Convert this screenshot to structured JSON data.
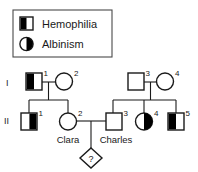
{
  "diagram": {
    "type": "pedigree-chart",
    "colors": {
      "fill": "#000000",
      "empty": "#ffffff",
      "stroke": "#1a1a1a",
      "legend_border": "#4a4a4a",
      "background": "#ffffff"
    },
    "legend": {
      "items": [
        {
          "key": "hemophilia",
          "label": "Hemophilia",
          "shape": "square",
          "fill_half": "left",
          "icon": "half-filled-square-icon"
        },
        {
          "key": "albinism",
          "label": "Albinism",
          "shape": "circle",
          "fill_half": "right",
          "icon": "half-filled-circle-icon"
        }
      ]
    },
    "generations": [
      {
        "key": "I",
        "label": "I"
      },
      {
        "key": "II",
        "label": "II"
      }
    ],
    "individuals": [
      {
        "id": "I-1",
        "generation": "I",
        "number": "1",
        "shape": "square",
        "sex": "male",
        "fill_half": "left",
        "affected": "hemophilia",
        "name": ""
      },
      {
        "id": "I-2",
        "generation": "I",
        "number": "2",
        "shape": "circle",
        "sex": "female",
        "fill_half": "none",
        "affected": "",
        "name": ""
      },
      {
        "id": "I-3",
        "generation": "I",
        "number": "3",
        "shape": "square",
        "sex": "male",
        "fill_half": "none",
        "affected": "",
        "name": ""
      },
      {
        "id": "I-4",
        "generation": "I",
        "number": "4",
        "shape": "circle",
        "sex": "female",
        "fill_half": "none",
        "affected": "",
        "name": ""
      },
      {
        "id": "II-1",
        "generation": "II",
        "number": "1",
        "shape": "square",
        "sex": "male",
        "fill_half": "right",
        "affected": "hemophilia",
        "name": ""
      },
      {
        "id": "II-2",
        "generation": "II",
        "number": "2",
        "shape": "circle",
        "sex": "female",
        "fill_half": "none",
        "affected": "",
        "name": "Clara"
      },
      {
        "id": "II-3",
        "generation": "II",
        "number": "3",
        "shape": "square",
        "sex": "male",
        "fill_half": "none",
        "affected": "",
        "name": "Charles"
      },
      {
        "id": "II-4",
        "generation": "II",
        "number": "4",
        "shape": "circle",
        "sex": "female",
        "fill_half": "right",
        "affected": "albinism",
        "name": ""
      },
      {
        "id": "II-5",
        "generation": "II",
        "number": "5",
        "shape": "square",
        "sex": "male",
        "fill_half": "left",
        "affected": "hemophilia",
        "name": ""
      }
    ],
    "offspring_unknown": {
      "id": "III-1",
      "shape": "diamond",
      "label": "?",
      "parents": [
        "II-2",
        "II-3"
      ]
    },
    "matings": [
      {
        "partners": [
          "I-1",
          "I-2"
        ],
        "children": [
          "II-1",
          "II-2"
        ]
      },
      {
        "partners": [
          "I-3",
          "I-4"
        ],
        "children": [
          "II-3",
          "II-4",
          "II-5"
        ]
      },
      {
        "partners": [
          "II-2",
          "II-3"
        ],
        "children": [
          "III-1"
        ]
      }
    ]
  }
}
